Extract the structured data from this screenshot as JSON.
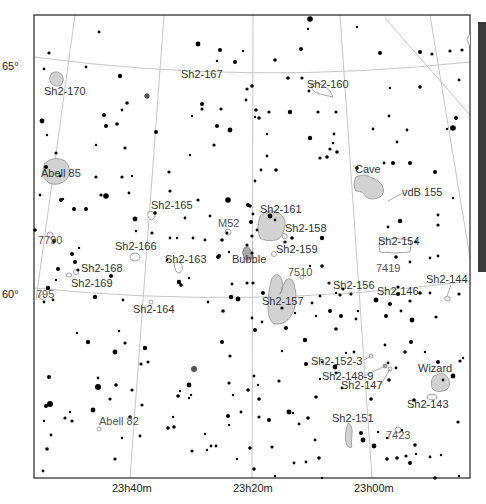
{
  "chart_title": "Sky chart: Cassiopeia / Cepheus region (Sharpless nebulae)",
  "colors": {
    "background": "#ffffff",
    "stars": "#000000",
    "nebula_fill": "#d2d2d2",
    "grid": "#b8b8b8",
    "side_bar": "#3a3a3a"
  },
  "axes": {
    "dec_labels": [
      {
        "text": "65°",
        "x": 2,
        "y": 70
      },
      {
        "text": "60°",
        "x": 2,
        "y": 298
      }
    ],
    "ra_labels": [
      {
        "text": "23h40m",
        "x": 130,
        "y": 492
      },
      {
        "text": "23h20m",
        "x": 240,
        "y": 492
      },
      {
        "text": "23h00m",
        "x": 354,
        "y": 492
      }
    ]
  },
  "objects": [
    {
      "name": "Sh2-170",
      "x": 44,
      "y": 95
    },
    {
      "name": "Sh2-167",
      "x": 181,
      "y": 78
    },
    {
      "name": "Sh2-160",
      "x": 307,
      "y": 88
    },
    {
      "name": "Abell 85",
      "x": 41,
      "y": 177
    },
    {
      "name": "Cave",
      "x": 355,
      "y": 173
    },
    {
      "name": "vdB 155",
      "x": 402,
      "y": 196
    },
    {
      "name": "Sh2-165",
      "x": 151,
      "y": 209
    },
    {
      "name": "Sh2-161",
      "x": 260,
      "y": 213
    },
    {
      "name": "M52",
      "x": 218,
      "y": 227
    },
    {
      "name": "Sh2-158",
      "x": 285,
      "y": 232
    },
    {
      "name": "7790",
      "x": 38,
      "y": 244
    },
    {
      "name": "Sh2-166",
      "x": 115,
      "y": 250
    },
    {
      "name": "Sh2-159",
      "x": 276,
      "y": 253
    },
    {
      "name": "Sh2-154",
      "x": 378,
      "y": 245
    },
    {
      "name": "Sh2-163",
      "x": 165,
      "y": 263
    },
    {
      "name": "Bubble",
      "x": 232,
      "y": 263
    },
    {
      "name": "Sh2-168",
      "x": 81,
      "y": 272
    },
    {
      "name": "7510",
      "x": 288,
      "y": 276
    },
    {
      "name": "7419",
      "x": 376,
      "y": 272
    },
    {
      "name": "Sh2-169",
      "x": 71,
      "y": 287
    },
    {
      "name": "Sh2-156",
      "x": 333,
      "y": 289
    },
    {
      "name": "Sh2-146",
      "x": 377,
      "y": 295
    },
    {
      "name": "Sh2-144",
      "x": 426,
      "y": 283
    },
    {
      "name": "795",
      "x": 36,
      "y": 298
    },
    {
      "name": "Sh2-157",
      "x": 262,
      "y": 305
    },
    {
      "name": "Sh2-164",
      "x": 133,
      "y": 313
    },
    {
      "name": "Sh2-152-3",
      "x": 311,
      "y": 365
    },
    {
      "name": "Sh2-148-9",
      "x": 322,
      "y": 380
    },
    {
      "name": "Wizard",
      "x": 418,
      "y": 372
    },
    {
      "name": "Sh2-147",
      "x": 341,
      "y": 389
    },
    {
      "name": "Sh2-143",
      "x": 407,
      "y": 408
    },
    {
      "name": "Abell 82",
      "x": 99,
      "y": 425
    },
    {
      "name": "Sh2-151",
      "x": 332,
      "y": 422
    },
    {
      "name": "7423",
      "x": 386,
      "y": 439
    }
  ]
}
